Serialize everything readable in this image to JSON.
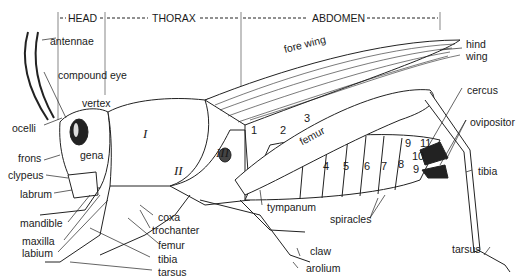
{
  "diagram": {
    "sections": [
      {
        "label": "HEAD"
      },
      {
        "label": "THORAX"
      },
      {
        "label": "ABDOMEN"
      }
    ],
    "labels": {
      "antennae": "antennae",
      "compound_eye": "compound eye",
      "vertex": "vertex",
      "ocelli": "ocelli",
      "frons": "frons",
      "gena": "gena",
      "clypeus": "clypeus",
      "labrum": "labrum",
      "mandible": "mandible",
      "maxilla": "maxilla",
      "labium": "labium",
      "coxa": "coxa",
      "trochanter": "trochanter",
      "femur_leg": "femur",
      "tibia_leg": "tibia",
      "tarsus_leg": "tarsus",
      "tympanum": "tympanum",
      "claw": "claw",
      "arolium": "arolium",
      "spiracles": "spiracles",
      "fore_wing": "fore wing",
      "hind_wing_1": "hind",
      "hind_wing_2": "wing",
      "cercus": "cercus",
      "ovipositor": "ovipositor",
      "tibia_hind": "tibia",
      "tarsus_hind": "tarsus",
      "femur_hind": "femur"
    },
    "thoracic_segments": [
      "I",
      "II",
      "III"
    ],
    "abdominal_segments": [
      "1",
      "2",
      "3",
      "4",
      "5",
      "6",
      "7",
      "8",
      "9",
      "9",
      "10",
      "11"
    ]
  }
}
